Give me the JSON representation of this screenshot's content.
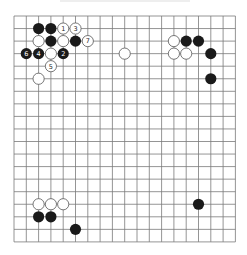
{
  "board": {
    "size": 19,
    "origin_x": 14,
    "origin_y": 16,
    "spacing_x": 12.3,
    "spacing_y": 12.55,
    "line_color": "#7a7a7a",
    "background": "#ffffff",
    "stone_radius": 5.6
  },
  "colors": {
    "black_stone": "#1a1a1a",
    "white_stone": "#ffffff",
    "white_stroke": "#555555",
    "label_on_black": "#ffffff",
    "label_on_white": "#222222"
  },
  "stones": [
    {
      "color": "black",
      "col": 2,
      "row": 1,
      "label": ""
    },
    {
      "color": "black",
      "col": 3,
      "row": 1,
      "label": ""
    },
    {
      "color": "white",
      "col": 4,
      "row": 1,
      "label": "1"
    },
    {
      "color": "white",
      "col": 5,
      "row": 1,
      "label": "3"
    },
    {
      "color": "white",
      "col": 2,
      "row": 2,
      "label": ""
    },
    {
      "color": "black",
      "col": 3,
      "row": 2,
      "label": ""
    },
    {
      "color": "white",
      "col": 4,
      "row": 2,
      "label": ""
    },
    {
      "color": "black",
      "col": 5,
      "row": 2,
      "label": ""
    },
    {
      "color": "white",
      "col": 6,
      "row": 2,
      "label": "7"
    },
    {
      "color": "black",
      "col": 1,
      "row": 3,
      "label": "6"
    },
    {
      "color": "black",
      "col": 2,
      "row": 3,
      "label": "4"
    },
    {
      "color": "white",
      "col": 3,
      "row": 3,
      "label": ""
    },
    {
      "color": "black",
      "col": 4,
      "row": 3,
      "label": "2"
    },
    {
      "color": "white",
      "col": 3,
      "row": 4,
      "label": "5"
    },
    {
      "color": "white",
      "col": 2,
      "row": 5,
      "label": ""
    },
    {
      "color": "white",
      "col": 9,
      "row": 3,
      "label": ""
    },
    {
      "color": "white",
      "col": 13,
      "row": 2,
      "label": ""
    },
    {
      "color": "black",
      "col": 14,
      "row": 2,
      "label": ""
    },
    {
      "color": "black",
      "col": 15,
      "row": 2,
      "label": ""
    },
    {
      "color": "white",
      "col": 13,
      "row": 3,
      "label": ""
    },
    {
      "color": "white",
      "col": 14,
      "row": 3,
      "label": ""
    },
    {
      "color": "black",
      "col": 16,
      "row": 3,
      "label": ""
    },
    {
      "color": "black",
      "col": 16,
      "row": 5,
      "label": ""
    },
    {
      "color": "white",
      "col": 2,
      "row": 15,
      "label": ""
    },
    {
      "color": "white",
      "col": 3,
      "row": 15,
      "label": ""
    },
    {
      "color": "white",
      "col": 4,
      "row": 15,
      "label": ""
    },
    {
      "color": "black",
      "col": 2,
      "row": 16,
      "label": ""
    },
    {
      "color": "black",
      "col": 3,
      "row": 16,
      "label": ""
    },
    {
      "color": "black",
      "col": 5,
      "row": 17,
      "label": ""
    },
    {
      "color": "black",
      "col": 15,
      "row": 15,
      "label": ""
    }
  ]
}
